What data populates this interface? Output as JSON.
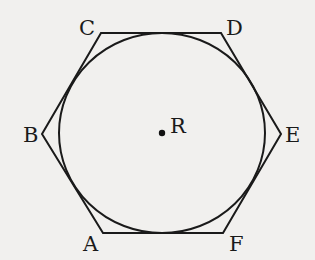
{
  "diagram": {
    "type": "geometry",
    "colors": {
      "background": "#f1f0ee",
      "stroke": "#1a1a1a"
    },
    "hexagon": {
      "vertices": [
        {
          "name": "A",
          "x": 103,
          "y": 233
        },
        {
          "name": "B",
          "x": 42,
          "y": 134
        },
        {
          "name": "C",
          "x": 101,
          "y": 33
        },
        {
          "name": "D",
          "x": 221,
          "y": 33
        },
        {
          "name": "E",
          "x": 281,
          "y": 134
        },
        {
          "name": "F",
          "x": 223,
          "y": 233
        }
      ]
    },
    "circle": {
      "cx": 162,
      "cy": 133,
      "rx": 103,
      "ry": 100
    },
    "center": {
      "name": "R",
      "x": 162,
      "y": 133
    }
  },
  "labels": {
    "A": "A",
    "B": "B",
    "C": "C",
    "D": "D",
    "E": "E",
    "F": "F",
    "R": "R"
  }
}
